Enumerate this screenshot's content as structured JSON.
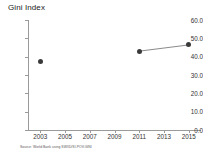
{
  "chart_data": {
    "type": "line",
    "title": "Gini Index",
    "xlabel": "",
    "ylabel": "",
    "x": [
      2003,
      2011,
      2015
    ],
    "values": [
      37.6,
      43.0,
      46.4
    ],
    "series": [
      {
        "name": "Gini Index",
        "x": [
          2003,
          2011,
          2015
        ],
        "values": [
          37.6,
          43.0,
          46.4
        ],
        "color": "#3a3a3a"
      }
    ],
    "segments": [
      {
        "from_x": 2011,
        "from_y": 43.0,
        "to_x": 2015,
        "to_y": 46.4
      }
    ],
    "xlim": [
      2002,
      2016
    ],
    "ylim": [
      0.0,
      60.0
    ],
    "xtick_labels": [
      "2003",
      "2005",
      "2007",
      "2009",
      "2011",
      "2013",
      "2015"
    ],
    "xticks": [
      2003,
      2005,
      2007,
      2009,
      2011,
      2013,
      2015
    ],
    "ytick_labels": [
      "60.0",
      "50.0",
      "40.0",
      "30.0",
      "20.0",
      "10.0",
      "0.0"
    ],
    "yticks": [
      60.0,
      50.0,
      40.0,
      30.0,
      20.0,
      10.0,
      0.0
    ],
    "grid": false,
    "legend": "none",
    "marker": "circle",
    "source_note": "Source: World Bank using SWIID/SI.POV.GINI",
    "colors": {
      "marker": "#3a3a3a",
      "line": "#7d7d7d",
      "axis": "#9a9a9a",
      "text": "#333333",
      "background": "#ffffff"
    }
  }
}
